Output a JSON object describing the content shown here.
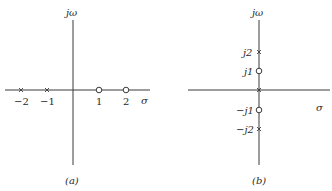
{
  "panels": [
    {
      "id": "a",
      "caption": "(a)",
      "vertical_axis_label": "jω",
      "horizontal_axis_label": "σ",
      "tick_labels": [
        "−2",
        "−1",
        "1",
        "2"
      ],
      "poles": [
        {
          "re": -2,
          "im": 0
        },
        {
          "re": -1,
          "im": 0
        }
      ],
      "zeros": [
        {
          "re": 1,
          "im": 0
        },
        {
          "re": 2,
          "im": 0
        }
      ]
    },
    {
      "id": "b",
      "caption": "(b)",
      "vertical_axis_label": "jω",
      "horizontal_axis_label": "σ",
      "tick_labels": [
        "j2",
        "j1",
        "−j1",
        "−j2"
      ],
      "poles": [
        {
          "re": 0,
          "im": 2
        },
        {
          "re": 0,
          "im": 0
        },
        {
          "re": 0,
          "im": -2
        }
      ],
      "zeros": [
        {
          "re": 0,
          "im": 1
        },
        {
          "re": 0,
          "im": -1
        }
      ]
    }
  ],
  "legend": {
    "pole_symbol": "×",
    "zero_symbol": "○"
  }
}
